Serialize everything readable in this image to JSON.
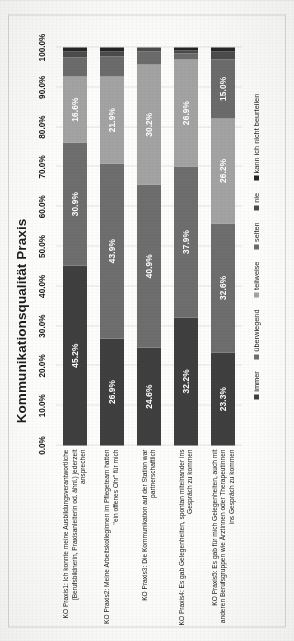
{
  "document": {
    "orientation": "rotated-90-ccw",
    "page_background": "#fdfdfb"
  },
  "chart_data": {
    "type": "bar",
    "subtype": "horizontal-stacked-100-percent",
    "title": "Kommunikationsqualität Praxis",
    "xlabel": "",
    "ylabel": "",
    "xlim": [
      0,
      100
    ],
    "grid": true,
    "legend_position": "bottom",
    "tick_labels": [
      "0.0%",
      "10.0%",
      "20.0%",
      "30.0%",
      "40.0%",
      "50.0%",
      "60.0%",
      "70.0%",
      "80.0%",
      "90.0%",
      "100.0%"
    ],
    "tick_values": [
      0,
      10,
      20,
      30,
      40,
      50,
      60,
      70,
      80,
      90,
      100
    ],
    "categories": [
      "KO Praxis1: Ich konnte meine Ausbildungsverantwortliche (Berufsbildnerin, Praxisanleiterin od. ähnl.) jederzeit ansprechen",
      "KO Praxis2: Meine Arbeitskolleginnen im Pflegeteam hatten \"ein offenes Ohr\" für mich",
      "KO Praxis3: Die Kommunikation auf der Station war partnerschaftlich",
      "KO Praxis4: Es gab Gelegenheiten, spontan miteinander ins Gespräch zu kommen",
      "KO Praxis5: Es gab für mich Gelegenheiten, auch mit anderen Berufsgruppen wie Ärztinnen oder Therapeutinnen ins Gespräch zu kommen"
    ],
    "series": [
      {
        "name": "immer",
        "color": "#3f3f3f",
        "values": [
          45.2,
          26.9,
          24.6,
          32.2,
          23.3
        ]
      },
      {
        "name": "überwiegend",
        "color": "#6e6e6e",
        "values": [
          30.9,
          43.9,
          40.9,
          37.9,
          32.6
        ]
      },
      {
        "name": "teilweise",
        "color": "#a3a3a3",
        "values": [
          16.6,
          21.9,
          30.2,
          26.9,
          26.2
        ]
      },
      {
        "name": "selten",
        "color": "#6b6b6b",
        "values": [
          4.8,
          5.1,
          3.2,
          1.5,
          15.0
        ]
      },
      {
        "name": "nie",
        "color": "#4a4a4a",
        "values": [
          1.4,
          1.1,
          1.1,
          0.8,
          1.9
        ]
      },
      {
        "name": "kann ich nicht beurteilen",
        "color": "#232323",
        "values": [
          1.1,
          1.1,
          0.0,
          0.7,
          1.0
        ]
      }
    ],
    "visible_data_labels": [
      {
        "category_index": 0,
        "series": "immer",
        "label": "45.2%"
      },
      {
        "category_index": 0,
        "series": "überwiegend",
        "label": "30.9%"
      },
      {
        "category_index": 0,
        "series": "teilweise",
        "label": "16.6%"
      },
      {
        "category_index": 1,
        "series": "immer",
        "label": "26.9%"
      },
      {
        "category_index": 1,
        "series": "überwiegend",
        "label": "43.9%"
      },
      {
        "category_index": 1,
        "series": "teilweise",
        "label": "21.9%"
      },
      {
        "category_index": 2,
        "series": "immer",
        "label": "24.6%"
      },
      {
        "category_index": 2,
        "series": "überwiegend",
        "label": "40.9%"
      },
      {
        "category_index": 2,
        "series": "teilweise",
        "label": "30.2%"
      },
      {
        "category_index": 3,
        "series": "immer",
        "label": "32.2%"
      },
      {
        "category_index": 3,
        "series": "überwiegend",
        "label": "37.9%"
      },
      {
        "category_index": 3,
        "series": "teilweise",
        "label": "26.9%"
      },
      {
        "category_index": 4,
        "series": "immer",
        "label": "23.3%"
      },
      {
        "category_index": 4,
        "series": "überwiegend",
        "label": "32.6%"
      },
      {
        "category_index": 4,
        "series": "teilweise",
        "label": "26.2%"
      },
      {
        "category_index": 4,
        "series": "selten",
        "label": "15.0%"
      }
    ]
  }
}
